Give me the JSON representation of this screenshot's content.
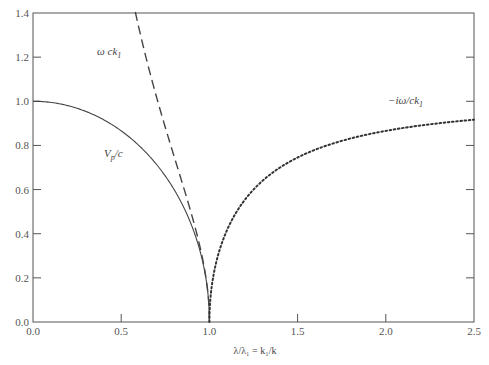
{
  "chart_data": {
    "type": "line",
    "title": "",
    "xlabel": "λ/λ₁ = k₁/k",
    "ylabel": "",
    "xlim": [
      0.0,
      2.5
    ],
    "ylim": [
      0.0,
      1.4
    ],
    "grid": false,
    "legend": "inline labels",
    "x_ticks": [
      "0.0",
      "0.5",
      "1.0",
      "1.5",
      "2.0",
      "2.5"
    ],
    "y_ticks": [
      "0.0",
      "0.2",
      "0.4",
      "0.6",
      "0.8",
      "1.0",
      "1.2",
      "1.4"
    ],
    "series": [
      {
        "name": "V_p/c",
        "style": "solid",
        "x": [
          0.0,
          0.1,
          0.2,
          0.3,
          0.4,
          0.5,
          0.6,
          0.7,
          0.8,
          0.9,
          0.95,
          0.98,
          1.0
        ],
        "values": [
          1.0,
          0.995,
          0.98,
          0.954,
          0.917,
          0.866,
          0.8,
          0.714,
          0.6,
          0.436,
          0.312,
          0.199,
          0.0
        ]
      },
      {
        "name": "ω/ck₁",
        "style": "dashed",
        "x": [
          0.58,
          0.6,
          0.65,
          0.7,
          0.75,
          0.8,
          0.85,
          0.9,
          0.95,
          0.98,
          1.0
        ],
        "values": [
          1.4,
          1.33,
          1.17,
          1.02,
          0.88,
          0.75,
          0.62,
          0.48,
          0.33,
          0.2,
          0.0
        ]
      },
      {
        "name": "−iω/ck₁",
        "style": "dotted",
        "x": [
          1.0,
          1.02,
          1.05,
          1.1,
          1.2,
          1.3,
          1.4,
          1.5,
          1.7,
          1.9,
          2.1,
          2.3,
          2.5
        ],
        "values": [
          0.0,
          0.197,
          0.305,
          0.417,
          0.553,
          0.639,
          0.7,
          0.745,
          0.809,
          0.85,
          0.879,
          0.9,
          0.917
        ]
      }
    ],
    "annotations": [
      {
        "text": "ω ck₁",
        "x": 0.27,
        "y": 1.25
      },
      {
        "text": "V_p/c",
        "x": 0.33,
        "y": 0.78
      },
      {
        "text": "−iω/ck₁",
        "x": 2.04,
        "y": 0.96
      }
    ]
  },
  "labels": {
    "x_axis_title": "λ/λ₁ = k₁/k",
    "dashed_label_main": "ω ck",
    "dashed_label_sub": "1",
    "solid_label_main": "V",
    "solid_label_sub": "p",
    "solid_label_tail": "/c",
    "dotted_label_main": "−iω/ck",
    "dotted_label_sub": "1"
  }
}
